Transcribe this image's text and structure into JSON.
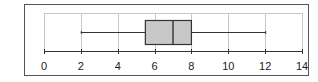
{
  "chart_data": {
    "type": "boxplot",
    "title": "",
    "xlabel": "",
    "ylabel": "",
    "xlim": [
      0,
      14
    ],
    "x_ticks": [
      0,
      2,
      4,
      6,
      8,
      10,
      12,
      14
    ],
    "x_tick_labels": [
      "0",
      "2",
      "4",
      "6",
      "8",
      "10",
      "12",
      "14"
    ],
    "grid": "vertical",
    "orientation": "horizontal",
    "series": [
      {
        "name": "",
        "min": 2,
        "q1": 5.5,
        "median": 7,
        "q3": 8,
        "max": 12
      }
    ],
    "colors": {
      "box_fill": "#c8c8c8",
      "box_stroke": "#333333",
      "whisker": "#333333",
      "grid": "#c8c8c8",
      "axis": "#333333",
      "frame": "#555555"
    }
  }
}
